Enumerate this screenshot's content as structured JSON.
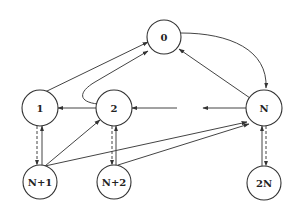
{
  "diagram": {
    "type": "state-transition-graph",
    "nodes": [
      {
        "id": "n0",
        "label": "0",
        "cx": 164,
        "cy": 37
      },
      {
        "id": "n1",
        "label": "1",
        "cx": 40,
        "cy": 108
      },
      {
        "id": "n2",
        "label": "2",
        "cx": 114,
        "cy": 108
      },
      {
        "id": "nN",
        "label": "N",
        "cx": 264,
        "cy": 108
      },
      {
        "id": "nN1",
        "label": "N+1",
        "cx": 40,
        "cy": 182
      },
      {
        "id": "nN2",
        "label": "N+2",
        "cx": 114,
        "cy": 182
      },
      {
        "id": "n2N",
        "label": "2N",
        "cx": 264,
        "cy": 183
      }
    ],
    "edges": [
      {
        "from": "0",
        "to": "N",
        "style": "solid",
        "curved": true
      },
      {
        "from": "N",
        "to": "0",
        "style": "solid"
      },
      {
        "from": "1",
        "to": "0",
        "style": "solid"
      },
      {
        "from": "2",
        "to": "0",
        "style": "solid",
        "curved": true
      },
      {
        "from": "2",
        "to": "1",
        "style": "solid"
      },
      {
        "from": "(gap)",
        "to": "2",
        "style": "solid"
      },
      {
        "from": "N",
        "to": "(gap)",
        "style": "solid"
      },
      {
        "from": "N+1",
        "to": "1",
        "style": "solid"
      },
      {
        "from": "1",
        "to": "N+1",
        "style": "dashed"
      },
      {
        "from": "N+1",
        "to": "2",
        "style": "solid"
      },
      {
        "from": "N+1",
        "to": "N",
        "style": "solid"
      },
      {
        "from": "N+2",
        "to": "2",
        "style": "solid"
      },
      {
        "from": "2",
        "to": "N+2",
        "style": "dashed"
      },
      {
        "from": "N+2",
        "to": "N",
        "style": "solid"
      },
      {
        "from": "2N",
        "to": "N",
        "style": "solid"
      },
      {
        "from": "N",
        "to": "2N",
        "style": "dashed"
      }
    ]
  }
}
